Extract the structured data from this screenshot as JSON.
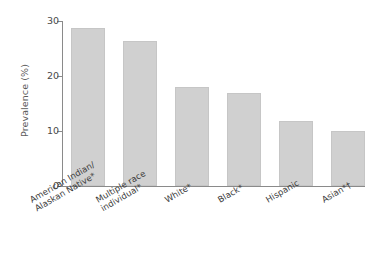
{
  "chart_data": {
    "type": "bar",
    "title": "",
    "subtitle": "",
    "xlabel": "",
    "ylabel": "Prevalence (%)",
    "categories": [
      "American Indian/\nAlaskan Native*",
      "Multiple race\nindividual*",
      "White*",
      "Black*",
      "Hispanic",
      "Asian*†"
    ],
    "values": [
      28.7,
      26.4,
      18.0,
      17.0,
      11.8,
      10.0
    ],
    "ylim": [
      0,
      30
    ],
    "yticks": [
      0,
      10,
      20,
      30
    ],
    "ytick_labels": [
      "0",
      "10",
      "20",
      "30"
    ],
    "grid": false,
    "legend": false,
    "bar_color": "#d0d0d0",
    "axis_color": "#8a8a8a"
  }
}
